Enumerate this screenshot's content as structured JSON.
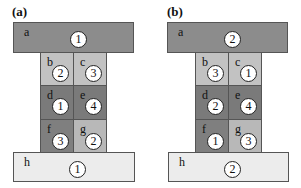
{
  "colors": {
    "a": "#8c8c8c",
    "b": "#c2c2c2",
    "c": "#c2c2c2",
    "d": "#7a7a7a",
    "e": "#7a7a7a",
    "f": "#7f7f7f",
    "g": "#b8b8b8",
    "h": "#ececec"
  },
  "panels": [
    {
      "label": "(a)",
      "blocks": {
        "a": {
          "letter": "a",
          "number": "1"
        },
        "b": {
          "letter": "b",
          "number": "2"
        },
        "c": {
          "letter": "c",
          "number": "3"
        },
        "d": {
          "letter": "d",
          "number": "1"
        },
        "e": {
          "letter": "e",
          "number": "4"
        },
        "f": {
          "letter": "f",
          "number": "3"
        },
        "g": {
          "letter": "g",
          "number": "2"
        },
        "h": {
          "letter": "h",
          "number": "1"
        }
      }
    },
    {
      "label": "(b)",
      "blocks": {
        "a": {
          "letter": "a",
          "number": "2"
        },
        "b": {
          "letter": "b",
          "number": "3"
        },
        "c": {
          "letter": "c",
          "number": "1"
        },
        "d": {
          "letter": "d",
          "number": "2"
        },
        "e": {
          "letter": "e",
          "number": "4"
        },
        "f": {
          "letter": "f",
          "number": "1"
        },
        "g": {
          "letter": "g",
          "number": "3"
        },
        "h": {
          "letter": "h",
          "number": "2"
        }
      }
    }
  ]
}
